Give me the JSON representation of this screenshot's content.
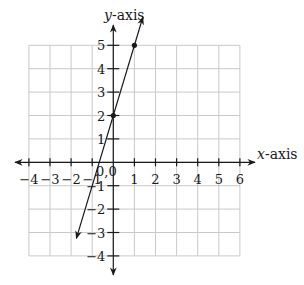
{
  "chart_data": {
    "type": "line",
    "title": "",
    "xlabel": "x-axis",
    "ylabel": "y-axis",
    "xlim": [
      -4,
      6
    ],
    "ylim": [
      -4,
      5
    ],
    "grid": true,
    "x_ticks": [
      -4,
      -3,
      -2,
      -1,
      1,
      2,
      3,
      4,
      5,
      6
    ],
    "y_ticks": [
      5,
      4,
      3,
      2,
      1,
      -1,
      -2,
      -3,
      -4
    ],
    "origin_label": "0,0",
    "series": [
      {
        "name": "y = 3x + 2",
        "equation": "y = 3x + 2",
        "line_extent": {
          "x_start": -1.75,
          "x_end": 1.4
        },
        "arrows": "both",
        "points": [
          {
            "x": 0,
            "y": 2
          },
          {
            "x": 1,
            "y": 5
          }
        ]
      }
    ]
  },
  "geometry": {
    "x0": 113.3,
    "y0": 162.3,
    "dx": 21.1,
    "dy": 23.4,
    "grid_cols": [
      -4,
      6
    ],
    "grid_rows": [
      -4,
      5
    ],
    "x_axis_arrow": [
      15,
      255
    ],
    "y_axis_arrow": [
      25,
      275
    ]
  }
}
